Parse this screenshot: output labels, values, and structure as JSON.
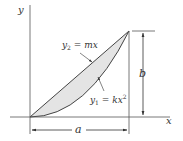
{
  "diagram": {
    "axes": {
      "x_label": "x",
      "y_label": "y"
    },
    "curves": [
      {
        "id": "y2",
        "label_var": "y",
        "label_sub": "2",
        "label_rhs": " = mx",
        "type": "line"
      },
      {
        "id": "y1",
        "label_var": "y",
        "label_sub": "1",
        "label_rhs": " = kx",
        "label_sup": "2",
        "type": "parabola"
      }
    ],
    "dimensions": {
      "width_label": "a",
      "height_label": "b"
    },
    "colors": {
      "line": "#333333",
      "fill": "#e4e4e4"
    }
  }
}
